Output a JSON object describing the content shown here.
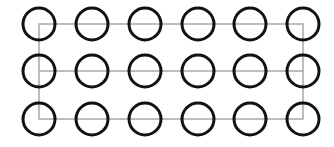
{
  "diagram": {
    "rows": 3,
    "columns": 6,
    "column_centers_x": [
      39,
      92,
      145,
      198,
      250,
      303
    ],
    "row_centers_y": [
      24,
      71,
      119
    ],
    "circle_radius": 16,
    "circle_stroke_width": 3,
    "colors": {
      "circle_stroke": "#111111",
      "line_stroke": "#a8a8a8",
      "background": "#ffffff"
    },
    "rectangle": {
      "x1": 39,
      "y1": 24,
      "x2": 303,
      "y2": 119
    },
    "middle_line": {
      "x1": 39,
      "x2": 303,
      "y": 71
    }
  }
}
